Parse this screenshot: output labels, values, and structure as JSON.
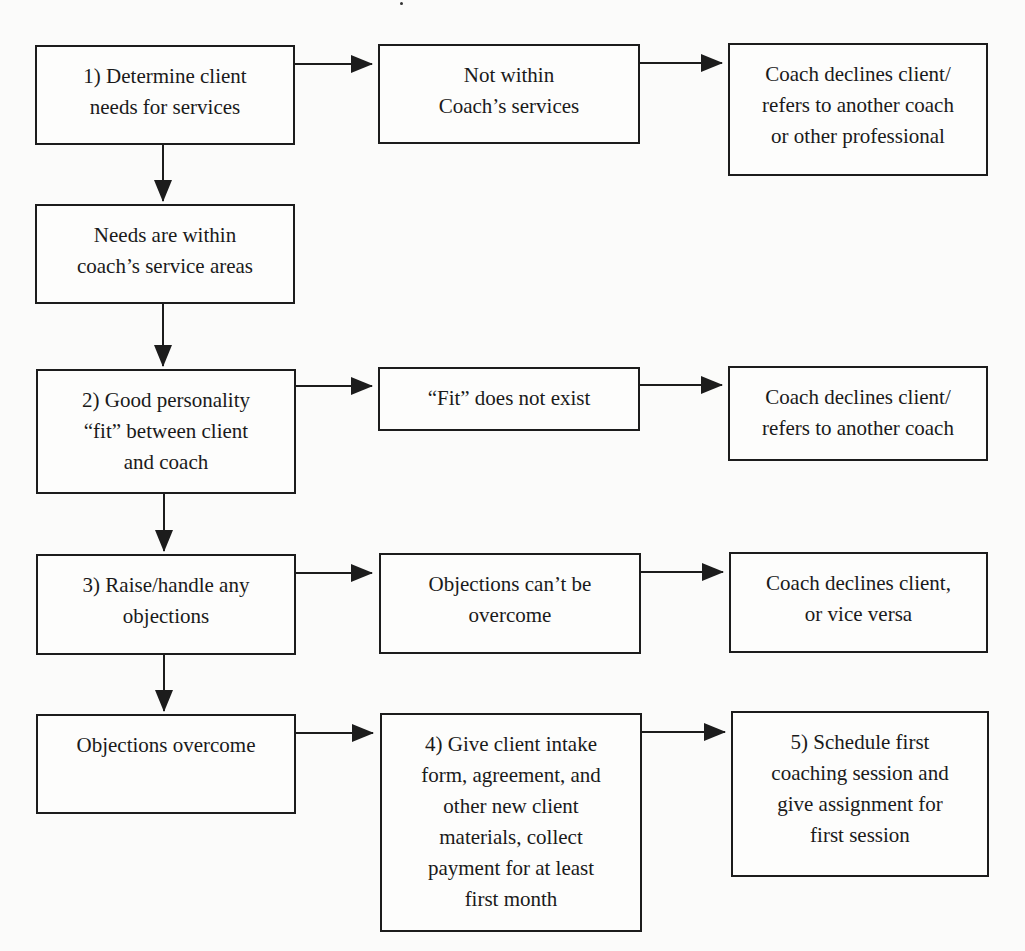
{
  "diagram": {
    "title_fragment": "THE COACH",
    "nodes": [
      {
        "id": "step1",
        "label": "1) Determine client\nneeds for services"
      },
      {
        "id": "not_within",
        "label": "Not within\nCoach’s services"
      },
      {
        "id": "decline1",
        "label": "Coach declines client/\nrefers to another coach\nor other professional"
      },
      {
        "id": "needs_within",
        "label": "Needs are within\ncoach’s service areas"
      },
      {
        "id": "step2",
        "label": "2) Good personality\n“fit” between client\nand coach"
      },
      {
        "id": "fit_not_exist",
        "label": "“Fit” does not exist"
      },
      {
        "id": "decline2",
        "label": "Coach declines client/\nrefers to another coach"
      },
      {
        "id": "step3",
        "label": "3) Raise/handle any\nobjections"
      },
      {
        "id": "objections_cant",
        "label": "Objections can’t be\novercome"
      },
      {
        "id": "decline3",
        "label": "Coach declines client,\nor vice versa"
      },
      {
        "id": "objections_overcome",
        "label": "Objections overcome"
      },
      {
        "id": "step4",
        "label": "4) Give client intake\nform, agreement, and\nother new client\nmaterials, collect\npayment for at least\nfirst month"
      },
      {
        "id": "step5",
        "label": "5) Schedule first\ncoaching session and\ngive assignment for\nfirst session"
      }
    ],
    "edges": [
      {
        "from": "step1",
        "to": "not_within"
      },
      {
        "from": "not_within",
        "to": "decline1"
      },
      {
        "from": "step1",
        "to": "needs_within"
      },
      {
        "from": "needs_within",
        "to": "step2"
      },
      {
        "from": "step2",
        "to": "fit_not_exist"
      },
      {
        "from": "fit_not_exist",
        "to": "decline2"
      },
      {
        "from": "step2",
        "to": "step3"
      },
      {
        "from": "step3",
        "to": "objections_cant"
      },
      {
        "from": "objections_cant",
        "to": "decline3"
      },
      {
        "from": "step3",
        "to": "objections_overcome"
      },
      {
        "from": "objections_overcome",
        "to": "step4"
      },
      {
        "from": "step4",
        "to": "step5"
      }
    ],
    "colors": {
      "stroke": "#1c1c1c",
      "background": "#fbfbfa"
    }
  }
}
